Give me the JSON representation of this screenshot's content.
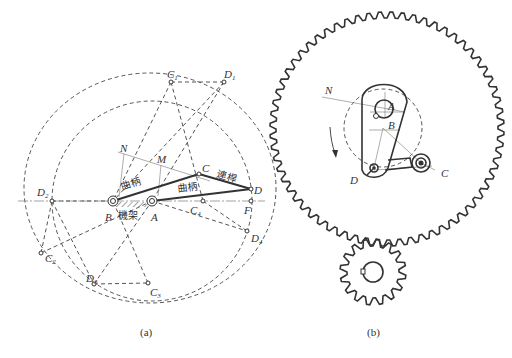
{
  "figure_a": {
    "caption": "(a)",
    "labels": {
      "N": "N",
      "M": "M",
      "C": "C",
      "D": "D",
      "B": "B",
      "A": "A",
      "F": "F",
      "C1": "C",
      "C1_sub": "1",
      "D1": "D",
      "D1_sub": "1",
      "D2": "D",
      "D2_sub": "2",
      "C2": "C",
      "C2_sub": "2",
      "D3": "D",
      "D3_sub": "3",
      "C3": "C",
      "C3_sub": "3",
      "C4": "C",
      "C4_sub": "4",
      "D4": "D",
      "D4_sub": "4"
    },
    "link_names": {
      "crank_1": "曲柄",
      "crank_2": "曲柄",
      "coupler": "連桿",
      "frame": "機架"
    }
  },
  "figure_b": {
    "caption": "(b)",
    "labels": {
      "N": "N",
      "A": "A",
      "B": "B",
      "C": "C",
      "D": "D"
    },
    "rotation_arrow": "clockwise-arrow",
    "large_gear_teeth": 64,
    "small_gear_teeth": 16
  }
}
